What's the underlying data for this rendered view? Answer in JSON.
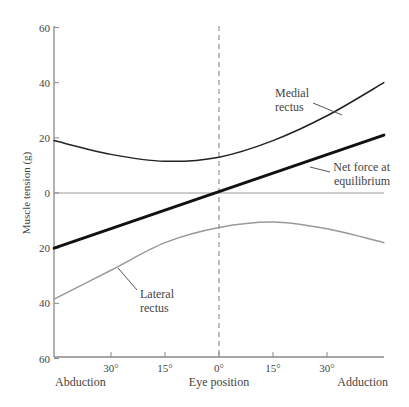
{
  "chart_data": {
    "type": "line",
    "title": "",
    "xlabel": "Eye position",
    "ylabel": "Muscle tension (g)",
    "x_left_label": "Abduction",
    "x_right_label": "Adduction",
    "xlim": [
      -45.8,
      45.8
    ],
    "ylim": [
      -60,
      60
    ],
    "x_ticks": [
      {
        "value": -30,
        "label": "30°"
      },
      {
        "value": -15,
        "label": "15°"
      },
      {
        "value": 0,
        "label": "0°"
      },
      {
        "value": 15,
        "label": "15°"
      },
      {
        "value": 30,
        "label": "30°"
      }
    ],
    "y_ticks": [
      {
        "value": 60,
        "label": "60"
      },
      {
        "value": 40,
        "label": "40"
      },
      {
        "value": 20,
        "label": "20"
      },
      {
        "value": 0,
        "label": "0"
      },
      {
        "value": -20,
        "label": "20"
      },
      {
        "value": -40,
        "label": "40"
      },
      {
        "value": -60,
        "label": "60"
      }
    ],
    "x": [
      -45.8,
      -30,
      -15,
      0,
      15,
      30,
      45.8
    ],
    "series": [
      {
        "name": "Medial rectus",
        "label_lines": [
          "Medial",
          "rectus"
        ],
        "color": "#222222",
        "width": 1.5,
        "values": [
          19,
          14,
          11.5,
          13,
          19,
          28,
          40
        ]
      },
      {
        "name": "Net force at equilibrium",
        "label_lines": [
          "Net force at",
          "equilibrium"
        ],
        "color": "#111111",
        "width": 3,
        "values": [
          -20,
          -13.1,
          -6.6,
          0,
          6.9,
          13.8,
          21
        ]
      },
      {
        "name": "Lateral rectus",
        "label_lines": [
          "Lateral",
          "rectus"
        ],
        "color": "#999999",
        "width": 1.5,
        "values": [
          -38.5,
          -28,
          -18,
          -12.5,
          -10.5,
          -13,
          -18
        ]
      }
    ],
    "reference_lines": [
      {
        "type": "horizontal",
        "value": 0,
        "style": "solid"
      },
      {
        "type": "vertical",
        "value": 0,
        "style": "dashed"
      }
    ],
    "grid": false,
    "legend": "inline annotations"
  }
}
